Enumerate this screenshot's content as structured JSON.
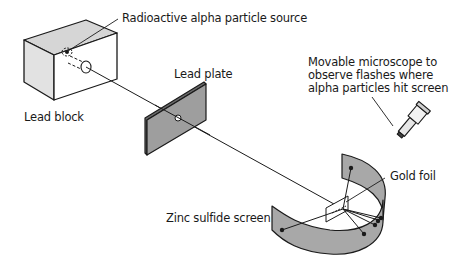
{
  "figure": {
    "labels": {
      "source": "Radioactive alpha particle source",
      "lead_block": "Lead block",
      "lead_plate": "Lead plate",
      "microscope": [
        "Movable microscope to",
        "observe flashes where",
        "alpha particles hit screen"
      ],
      "gold_foil": "Gold foil",
      "screen": "Zinc sulfide screen"
    },
    "colors": {
      "line": "#1a1a1a",
      "lead_gray": "#a9a9a9",
      "top_face": "#d4d4d4",
      "front_face": "#e4e4e4",
      "screen_gray": "#a6a6a6",
      "background": "#ffffff"
    }
  }
}
